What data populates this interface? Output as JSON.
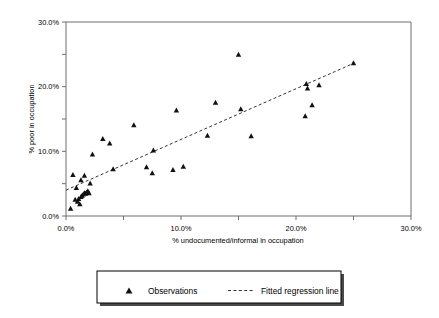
{
  "chart_data": {
    "type": "scatter",
    "title": "",
    "xlabel": "% undocumented/informal in occupation",
    "ylabel": "% poor in occupation",
    "xlim": [
      0,
      30
    ],
    "ylim": [
      0,
      30
    ],
    "xticks": [
      0,
      5,
      10,
      15,
      20,
      25,
      30
    ],
    "yticks": [
      0,
      5,
      10,
      15,
      20,
      25,
      30
    ],
    "xticklabels": [
      "0.0%",
      "",
      "10.0%",
      "",
      "20.0%",
      "",
      "30.0%"
    ],
    "yticklabels": [
      "0.0%",
      "",
      "10.0%",
      "",
      "20.0%",
      "",
      "30.0%"
    ],
    "xticklabels_major": [
      "0.0%",
      "10.0%",
      "20.0%",
      "30.0%"
    ],
    "yticklabels_major": [
      "0.0%",
      "10.0%",
      "20.0%",
      "30.0%"
    ],
    "grid": false,
    "legend_position": "below",
    "series": [
      {
        "name": "Observations",
        "marker": "triangle",
        "color": "#111111",
        "points": [
          [
            0.4,
            1.2
          ],
          [
            0.6,
            6.4
          ],
          [
            0.8,
            2.6
          ],
          [
            0.9,
            4.4
          ],
          [
            1.0,
            2.3
          ],
          [
            1.1,
            2.7
          ],
          [
            1.2,
            1.9
          ],
          [
            1.3,
            3.0
          ],
          [
            1.3,
            5.6
          ],
          [
            1.4,
            3.2
          ],
          [
            1.5,
            3.4
          ],
          [
            1.6,
            3.6
          ],
          [
            1.6,
            6.3
          ],
          [
            1.7,
            3.5
          ],
          [
            1.8,
            3.7
          ],
          [
            1.9,
            3.9
          ],
          [
            2.0,
            3.6
          ],
          [
            2.1,
            5.1
          ],
          [
            2.3,
            9.6
          ],
          [
            3.2,
            12.0
          ],
          [
            3.8,
            11.3
          ],
          [
            4.1,
            7.3
          ],
          [
            5.9,
            14.1
          ],
          [
            7.0,
            7.6
          ],
          [
            7.5,
            6.7
          ],
          [
            7.6,
            10.2
          ],
          [
            9.3,
            7.2
          ],
          [
            9.6,
            16.4
          ],
          [
            10.2,
            7.7
          ],
          [
            12.3,
            12.5
          ],
          [
            13.0,
            17.6
          ],
          [
            15.0,
            25.0
          ],
          [
            15.2,
            16.6
          ],
          [
            16.1,
            12.4
          ],
          [
            20.8,
            15.5
          ],
          [
            20.9,
            20.5
          ],
          [
            21.0,
            19.8
          ],
          [
            21.4,
            17.2
          ],
          [
            22.0,
            20.3
          ],
          [
            25.0,
            23.7
          ]
        ]
      }
    ],
    "fit": {
      "name": "Fitted regression line",
      "style": "dashed",
      "color": "#333333",
      "intercept": 4.0,
      "slope": 0.785,
      "x_start": 0.0,
      "x_end": 25.0,
      "y_start": 4.0,
      "y_end": 23.6
    }
  },
  "legend": {
    "items": [
      {
        "label": "Observations",
        "glyph": "triangle-marker-icon"
      },
      {
        "label": "Fitted regression line",
        "glyph": "dashed-line-icon"
      }
    ]
  },
  "colors": {
    "marker": "#111111",
    "fit_line": "#333333",
    "axis": "#6e6e6e",
    "background": "#ffffff"
  }
}
